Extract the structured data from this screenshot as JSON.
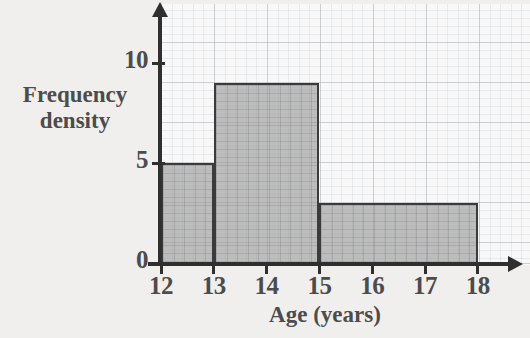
{
  "chart_data": {
    "type": "bar",
    "title": "",
    "subtitle": "",
    "xlabel": "Age (years)",
    "ylabel_lines": [
      "Frequency",
      "density"
    ],
    "ylabel": "Frequency density",
    "xlim": [
      12,
      18
    ],
    "ylim": [
      0,
      12
    ],
    "x_ticks": [
      12,
      13,
      14,
      15,
      16,
      17,
      18
    ],
    "x_tick_labels": [
      "12",
      "13",
      "14",
      "15",
      "16",
      "17",
      "18"
    ],
    "y_ticks": [
      0,
      5,
      10
    ],
    "y_tick_labels": [
      "0",
      "5",
      "10"
    ],
    "grid": true,
    "grid_style": "graph-paper",
    "legend": "none",
    "bars": [
      {
        "label": "12-13",
        "x_start": 12,
        "x_end": 13,
        "value": 5,
        "width": 1,
        "frequency": 5
      },
      {
        "label": "13-15",
        "x_start": 13,
        "x_end": 15,
        "value": 9,
        "width": 2,
        "frequency": 18
      },
      {
        "label": "15-18",
        "x_start": 15,
        "x_end": 18,
        "value": 3,
        "width": 3,
        "frequency": 9
      }
    ],
    "categories": [
      "12-13",
      "13-15",
      "15-18"
    ],
    "values": [
      5,
      9,
      3
    ]
  },
  "style": {
    "background": "#f1efed",
    "plot_background": "#fdfdfd",
    "bar_fill": "#b5b5b5",
    "bar_edge": "#3b3b3b",
    "axis_color": "#2f2f2f",
    "text_color": "#4c4c4c",
    "grid_color": "#8c94a0"
  }
}
